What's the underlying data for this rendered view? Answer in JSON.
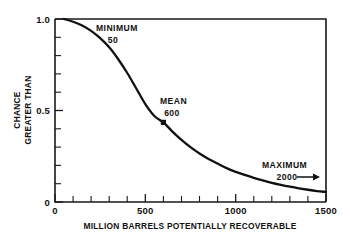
{
  "chart_data": {
    "type": "line",
    "title": "",
    "subtitle": "",
    "xlabel": "MILLION BARRELS POTENTIALLY RECOVERABLE",
    "ylabel_line1": "CHANCE",
    "ylabel_line2": "GREATER THAN",
    "xlim": [
      0,
      1500
    ],
    "ylim": [
      0,
      1.0
    ],
    "grid": false,
    "legend": "none",
    "x_ticks": [
      0,
      500,
      1000,
      1500
    ],
    "x_tick_labels": [
      "0",
      "500",
      "1000",
      "1500"
    ],
    "x_minor_tick_step": 100,
    "y_ticks": [
      0,
      0.5,
      1.0
    ],
    "y_tick_labels": [
      "0",
      "0.5",
      "1.0"
    ],
    "y_minor_tick_step": 0.1,
    "series": [
      {
        "name": "Chance greater than",
        "x": [
          50,
          100,
          150,
          200,
          250,
          300,
          350,
          400,
          450,
          500,
          550,
          600,
          650,
          700,
          750,
          800,
          850,
          900,
          950,
          1000,
          1050,
          1100,
          1150,
          1200,
          1250,
          1300,
          1350,
          1400,
          1450,
          1500
        ],
        "y": [
          1.0,
          0.985,
          0.965,
          0.935,
          0.895,
          0.845,
          0.78,
          0.705,
          0.62,
          0.535,
          0.47,
          0.435,
          0.385,
          0.34,
          0.3,
          0.265,
          0.235,
          0.21,
          0.185,
          0.165,
          0.148,
          0.132,
          0.118,
          0.105,
          0.094,
          0.084,
          0.075,
          0.067,
          0.06,
          0.055
        ]
      }
    ],
    "annotations": [
      {
        "id": "minimum",
        "label": "MINIMUM",
        "value": "50",
        "x": 50,
        "y": 1.0,
        "marker": false
      },
      {
        "id": "mean",
        "label": "MEAN",
        "value": "600",
        "x": 600,
        "y": 0.435,
        "marker": true
      },
      {
        "id": "maximum",
        "label": "MAXIMUM",
        "value": "2000",
        "x": 1500,
        "y": 0.13,
        "marker": false,
        "arrow": "right"
      }
    ],
    "colors": {
      "curve": "#111111",
      "axis": "#1a1a1a",
      "background": "#ffffff"
    }
  }
}
